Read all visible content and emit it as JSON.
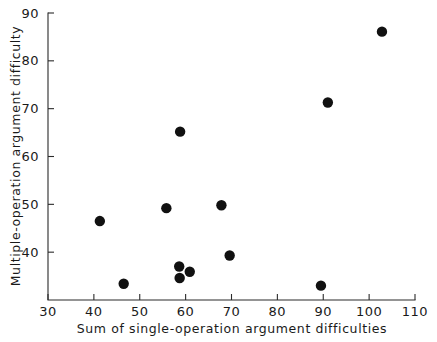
{
  "chart_data": {
    "type": "scatter",
    "title": "",
    "subtitle": "",
    "xlabel": "Sum of single-operation argument difficulties",
    "ylabel": "Multiple-operation argument difficulty",
    "xlim": [
      30,
      110
    ],
    "ylim": [
      30,
      90
    ],
    "xticks": [
      30,
      40,
      50,
      60,
      70,
      80,
      90,
      100,
      110
    ],
    "yticks": [
      40,
      50,
      60,
      70,
      80,
      90
    ],
    "xtick_labels": [
      "30",
      "40",
      "50",
      "60",
      "70",
      "80",
      "90",
      "100",
      "110"
    ],
    "ytick_labels": [
      "40",
      "50",
      "60",
      "70",
      "80",
      "90"
    ],
    "grid": false,
    "legend": null,
    "tick_direction": "in",
    "marker": "filled-circle",
    "marker_color": "#111111",
    "marker_size_px": 5.2,
    "annotations": [],
    "points": [
      {
        "x": 41.3,
        "y": 46.5
      },
      {
        "x": 46.5,
        "y": 33.4
      },
      {
        "x": 55.8,
        "y": 49.2
      },
      {
        "x": 58.8,
        "y": 65.2
      },
      {
        "x": 58.6,
        "y": 37.0
      },
      {
        "x": 58.7,
        "y": 34.6
      },
      {
        "x": 60.9,
        "y": 35.9
      },
      {
        "x": 67.8,
        "y": 49.8
      },
      {
        "x": 69.6,
        "y": 39.3
      },
      {
        "x": 89.5,
        "y": 33.0
      },
      {
        "x": 91.0,
        "y": 71.3
      },
      {
        "x": 102.8,
        "y": 86.1
      }
    ]
  }
}
